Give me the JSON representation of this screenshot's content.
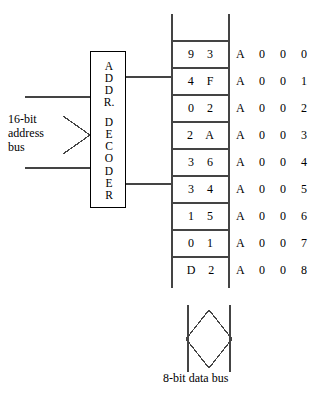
{
  "diagram": {
    "line_color": "#444444",
    "text_color": "#000000",
    "background": "#ffffff"
  },
  "address_bus": {
    "label_lines": [
      "16-bit",
      "address",
      "bus"
    ],
    "marker": "chevron-right-icon"
  },
  "decoder": {
    "name": "ADDR. DECODER",
    "letters": [
      "A",
      "D",
      "D",
      "R.",
      "",
      "D",
      "E",
      "C",
      "O",
      "D",
      "E",
      "R"
    ]
  },
  "memory": {
    "empty_top": "",
    "empty_bottom": "",
    "rows": [
      {
        "value": "9 3",
        "address": "A 0 0 0"
      },
      {
        "value": "4 F",
        "address": "A 0 0 1"
      },
      {
        "value": "0 2",
        "address": "A 0 0 2"
      },
      {
        "value": "2 A",
        "address": "A 0 0 3"
      },
      {
        "value": "3 6",
        "address": "A 0 0 4"
      },
      {
        "value": "3 4",
        "address": "A 0 0 5"
      },
      {
        "value": "1 5",
        "address": "A 0 0 6"
      },
      {
        "value": "0 1",
        "address": "A 0 0 7"
      },
      {
        "value": "D 2",
        "address": "A 0 0 8"
      }
    ]
  },
  "data_bus": {
    "label": "8-bit data bus",
    "marker": "diamond-bus-icon"
  }
}
